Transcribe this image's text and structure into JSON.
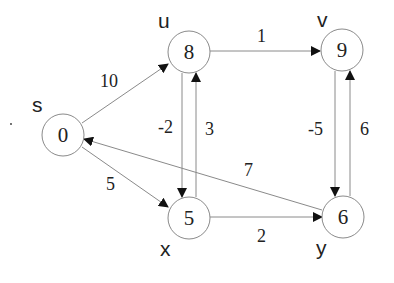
{
  "diagram": {
    "type": "directed-weighted-graph",
    "nodes": [
      {
        "id": "s",
        "name": "s",
        "value": "0",
        "cx": 63,
        "cy": 135,
        "label_x": 32,
        "label_y": 112
      },
      {
        "id": "u",
        "name": "u",
        "value": "8",
        "cx": 189,
        "cy": 52,
        "label_x": 158,
        "label_y": 28
      },
      {
        "id": "v",
        "name": "v",
        "value": "9",
        "cx": 342,
        "cy": 50,
        "label_x": 317,
        "label_y": 27
      },
      {
        "id": "x",
        "name": "x",
        "value": "5",
        "cx": 189,
        "cy": 218,
        "label_x": 160,
        "label_y": 256
      },
      {
        "id": "y",
        "name": "y",
        "value": "6",
        "cx": 343,
        "cy": 217,
        "label_x": 316,
        "label_y": 255
      }
    ],
    "edges": [
      {
        "from": "s",
        "to": "u",
        "weight": "10",
        "x1": 82,
        "y1": 123,
        "x2": 168,
        "y2": 64,
        "lx": 100,
        "ly": 87
      },
      {
        "from": "s",
        "to": "x",
        "weight": "5",
        "x1": 82,
        "y1": 147,
        "x2": 168,
        "y2": 207,
        "lx": 106,
        "ly": 190
      },
      {
        "from": "u",
        "to": "v",
        "weight": "1",
        "x1": 210,
        "y1": 51,
        "x2": 320,
        "y2": 51,
        "lx": 257,
        "ly": 42
      },
      {
        "from": "u",
        "to": "x",
        "weight": "-2",
        "x1": 182,
        "y1": 73,
        "x2": 182,
        "y2": 197,
        "lx": 158,
        "ly": 133
      },
      {
        "from": "x",
        "to": "u",
        "weight": "3",
        "x1": 196,
        "y1": 197,
        "x2": 196,
        "y2": 73,
        "lx": 205,
        "ly": 135
      },
      {
        "from": "v",
        "to": "y",
        "weight": "-5",
        "x1": 335,
        "y1": 71,
        "x2": 335,
        "y2": 196,
        "lx": 308,
        "ly": 135
      },
      {
        "from": "y",
        "to": "v",
        "weight": "6",
        "x1": 350,
        "y1": 196,
        "x2": 350,
        "y2": 71,
        "lx": 360,
        "ly": 135
      },
      {
        "from": "y",
        "to": "s",
        "weight": "7",
        "x1": 322,
        "y1": 210,
        "x2": 84,
        "y2": 139,
        "lx": 244,
        "ly": 176
      },
      {
        "from": "x",
        "to": "y",
        "weight": "2",
        "x1": 210,
        "y1": 217,
        "x2": 322,
        "y2": 217,
        "lx": 257,
        "ly": 242
      }
    ],
    "stray_dot": {
      "x": 11,
      "y": 124
    }
  },
  "colors": {
    "stroke": "#8a8a8a",
    "arrow": "#111111",
    "text": "#222222",
    "background": "#ffffff"
  }
}
